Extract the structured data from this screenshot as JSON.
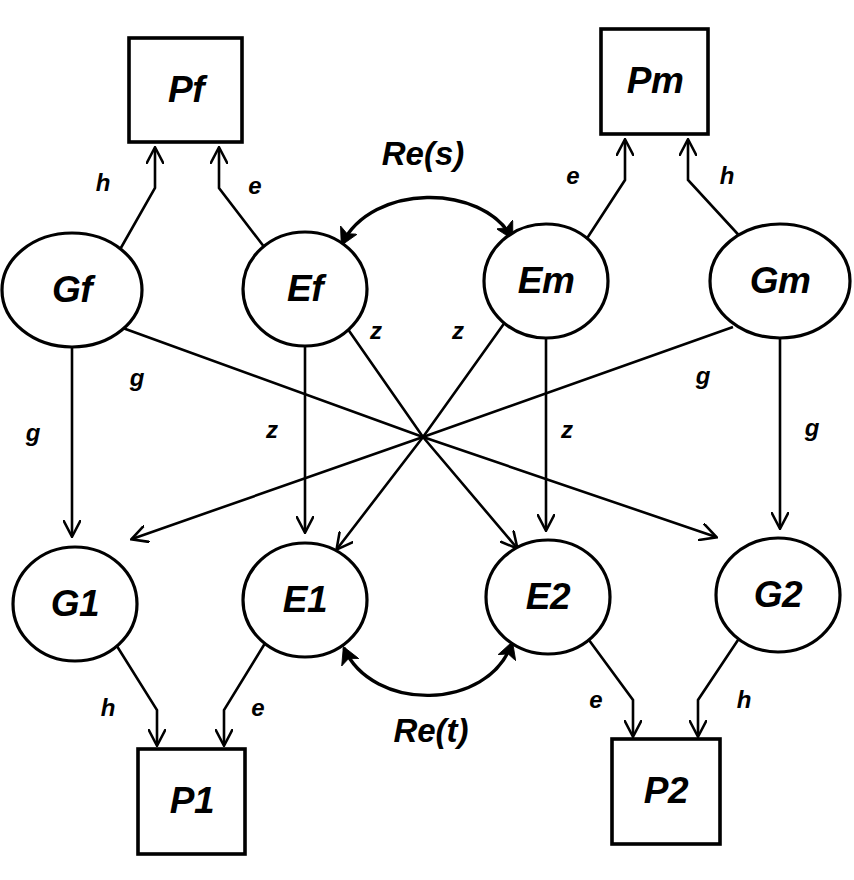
{
  "diagram": {
    "type": "path-diagram",
    "background_color": "#ffffff",
    "stroke_color": "#000000",
    "nodes": [
      {
        "id": "Pf",
        "label": "Pf",
        "shape": "rect",
        "cx": 186,
        "cy": 90,
        "w": 113,
        "h": 104
      },
      {
        "id": "Pm",
        "label": "Pm",
        "shape": "rect",
        "cx": 655,
        "cy": 82,
        "w": 107,
        "h": 105
      },
      {
        "id": "Gf",
        "label": "Gf",
        "shape": "ellipse",
        "cx": 72,
        "cy": 290,
        "rx": 70,
        "ry": 57
      },
      {
        "id": "Ef",
        "label": "Ef",
        "shape": "ellipse",
        "cx": 305,
        "cy": 289,
        "rx": 62,
        "ry": 57
      },
      {
        "id": "Em",
        "label": "Em",
        "shape": "ellipse",
        "cx": 546,
        "cy": 281,
        "rx": 62,
        "ry": 57
      },
      {
        "id": "Gm",
        "label": "Gm",
        "shape": "ellipse",
        "cx": 780,
        "cy": 281,
        "rx": 70,
        "ry": 57
      },
      {
        "id": "G1",
        "label": "G1",
        "shape": "ellipse",
        "cx": 75,
        "cy": 604,
        "rx": 62,
        "ry": 57
      },
      {
        "id": "E1",
        "label": "E1",
        "shape": "ellipse",
        "cx": 305,
        "cy": 600,
        "rx": 62,
        "ry": 57
      },
      {
        "id": "E2",
        "label": "E2",
        "shape": "ellipse",
        "cx": 548,
        "cy": 597,
        "rx": 62,
        "ry": 57
      },
      {
        "id": "G2",
        "label": "G2",
        "shape": "ellipse",
        "cx": 778,
        "cy": 595,
        "rx": 62,
        "ry": 57
      },
      {
        "id": "P1",
        "label": "P1",
        "shape": "rect",
        "cx": 192,
        "cy": 802,
        "w": 107,
        "h": 105
      },
      {
        "id": "P2",
        "label": "P2",
        "shape": "rect",
        "cx": 666,
        "cy": 792,
        "w": 108,
        "h": 105
      }
    ],
    "path_labels": [
      {
        "id": "h-pf",
        "text": "h",
        "x": 103,
        "y": 185
      },
      {
        "id": "e-pf",
        "text": "e",
        "x": 255,
        "y": 188
      },
      {
        "id": "e-pm",
        "text": "e",
        "x": 573,
        "y": 178
      },
      {
        "id": "h-pm",
        "text": "h",
        "x": 727,
        "y": 178
      },
      {
        "id": "g-gf-g2",
        "text": "g",
        "x": 137,
        "y": 380
      },
      {
        "id": "g-gf-g1",
        "text": "g",
        "x": 33,
        "y": 435
      },
      {
        "id": "z-ef-e2",
        "text": "z",
        "x": 376,
        "y": 333
      },
      {
        "id": "z-em-e1",
        "text": "z",
        "x": 458,
        "y": 333
      },
      {
        "id": "z-ef-e1",
        "text": "z",
        "x": 272,
        "y": 432
      },
      {
        "id": "z-em-e2",
        "text": "z",
        "x": 567,
        "y": 432
      },
      {
        "id": "g-gm-g1",
        "text": "g",
        "x": 703,
        "y": 378
      },
      {
        "id": "g-gm-g2",
        "text": "g",
        "x": 812,
        "y": 430
      },
      {
        "id": "h-p1",
        "text": "h",
        "x": 108,
        "y": 710
      },
      {
        "id": "e-p1",
        "text": "e",
        "x": 258,
        "y": 710
      },
      {
        "id": "e-p2",
        "text": "e",
        "x": 596,
        "y": 702
      },
      {
        "id": "h-p2",
        "text": "h",
        "x": 744,
        "y": 702
      }
    ],
    "correlations": [
      {
        "id": "Re-s",
        "label": "Re(s)",
        "between": [
          "Ef",
          "Em"
        ],
        "label_x": 423,
        "label_y": 156,
        "direction": "double"
      },
      {
        "id": "Re-t",
        "label": "Re(t)",
        "label_x": 431,
        "label_y": 733,
        "between": [
          "E1",
          "E2"
        ],
        "direction": "double"
      }
    ],
    "edges": [
      {
        "from": "Gf",
        "to": "Pf",
        "label": "h"
      },
      {
        "from": "Ef",
        "to": "Pf",
        "label": "e"
      },
      {
        "from": "Em",
        "to": "Pm",
        "label": "e"
      },
      {
        "from": "Gm",
        "to": "Pm",
        "label": "h"
      },
      {
        "from": "Gf",
        "to": "G1",
        "label": "g"
      },
      {
        "from": "Gf",
        "to": "G2",
        "label": "g"
      },
      {
        "from": "Ef",
        "to": "E1",
        "label": "z"
      },
      {
        "from": "Ef",
        "to": "E2",
        "label": "z"
      },
      {
        "from": "Em",
        "to": "E1",
        "label": "z"
      },
      {
        "from": "Em",
        "to": "E2",
        "label": "z"
      },
      {
        "from": "Gm",
        "to": "G1",
        "label": "g"
      },
      {
        "from": "Gm",
        "to": "G2",
        "label": "g"
      },
      {
        "from": "G1",
        "to": "P1",
        "label": "h"
      },
      {
        "from": "E1",
        "to": "P1",
        "label": "e"
      },
      {
        "from": "E2",
        "to": "P2",
        "label": "e"
      },
      {
        "from": "G2",
        "to": "P2",
        "label": "h"
      }
    ]
  }
}
